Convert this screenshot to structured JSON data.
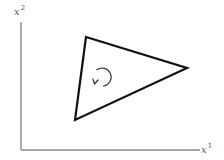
{
  "figure": {
    "axes": {
      "y_label": {
        "base": "x",
        "superscript": "2"
      },
      "x_label": {
        "base": "x",
        "superscript": "1"
      },
      "color": "#8a8a8a",
      "origin": [
        21,
        150
      ],
      "y_axis_top": [
        21,
        22
      ],
      "x_axis_right": [
        200,
        150
      ]
    },
    "triangle": {
      "vertices": [
        [
          86,
          37
        ],
        [
          187,
          68
        ],
        [
          75,
          120
        ]
      ],
      "stroke": "#111111",
      "stroke_width": 2.2
    },
    "orientation_arrow": {
      "direction": "counterclockwise",
      "center": [
        101,
        77
      ],
      "radius": 9,
      "stroke": "#333333"
    }
  }
}
